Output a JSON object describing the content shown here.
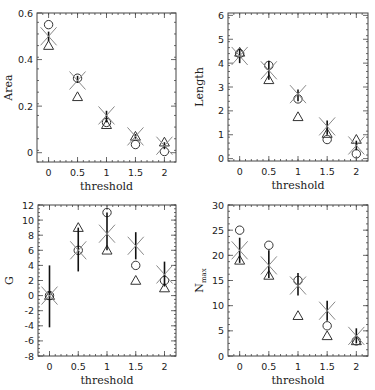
{
  "chart_data": [
    {
      "type": "scatter",
      "panel": "top-left",
      "xlabel": "threshold",
      "ylabel": "Area",
      "x": [
        0,
        0.5,
        1,
        1.5,
        2
      ],
      "xticks": [
        "0",
        "0.5",
        "1",
        "1.5",
        "2"
      ],
      "xlim": [
        -0.2,
        2.2
      ],
      "ylim": [
        -0.04,
        0.6
      ],
      "yticks": [
        0,
        0.2,
        0.4,
        0.6
      ],
      "yticklabels": [
        "0",
        "0.2",
        "0.4",
        "0.6"
      ],
      "series": [
        {
          "name": "circles",
          "marker": "circle",
          "values": [
            0.55,
            0.32,
            0.13,
            0.035,
            0.005
          ]
        },
        {
          "name": "triangles",
          "marker": "triangle",
          "values": [
            0.46,
            0.24,
            0.12,
            0.07,
            0.045
          ]
        },
        {
          "name": "mean",
          "marker": "cross",
          "values": [
            0.5,
            0.31,
            0.16,
            0.07,
            0.03
          ],
          "err_low": [
            0.48,
            0.3,
            0.13,
            0.06,
            0.015
          ],
          "err_high": [
            0.52,
            0.33,
            0.18,
            0.08,
            0.045
          ]
        }
      ]
    },
    {
      "type": "scatter",
      "panel": "top-right",
      "xlabel": "threshold",
      "ylabel": "Length",
      "x": [
        0,
        0.5,
        1,
        1.5,
        2
      ],
      "xticks": [
        "0",
        "0.5",
        "1",
        "1.5",
        "2"
      ],
      "xlim": [
        -0.2,
        2.2
      ],
      "ylim": [
        -0.1,
        6.1
      ],
      "yticks": [
        0,
        1,
        2,
        3,
        4,
        5,
        6
      ],
      "yticklabels": [
        "0",
        "1",
        "2",
        "3",
        "4",
        "5",
        "6"
      ],
      "series": [
        {
          "name": "circles",
          "marker": "circle",
          "values": [
            4.4,
            3.9,
            2.5,
            0.8,
            0.2
          ]
        },
        {
          "name": "triangles",
          "marker": "triangle",
          "values": [
            4.45,
            3.3,
            1.75,
            1.05,
            0.8
          ]
        },
        {
          "name": "mean",
          "marker": "cross",
          "values": [
            4.3,
            3.7,
            2.7,
            1.35,
            0.55
          ],
          "err_low": [
            4.0,
            3.3,
            2.4,
            1.0,
            0.35
          ],
          "err_high": [
            4.6,
            4.1,
            2.9,
            1.6,
            0.75
          ]
        }
      ]
    },
    {
      "type": "scatter",
      "panel": "bottom-left",
      "xlabel": "threshold",
      "ylabel": "G",
      "x": [
        0,
        0.5,
        1,
        1.5,
        2
      ],
      "xticks": [
        "0",
        "0.5",
        "1",
        "1.5",
        "2"
      ],
      "xlim": [
        -0.2,
        2.2
      ],
      "ylim": [
        -8,
        12
      ],
      "yticks": [
        -8,
        -6,
        -4,
        -2,
        0,
        2,
        4,
        6,
        8,
        10,
        12
      ],
      "yticklabels": [
        "-8",
        "-6",
        "-4",
        "-2",
        "0",
        "2",
        "4",
        "6",
        "8",
        "10",
        "12"
      ],
      "series": [
        {
          "name": "circles",
          "marker": "circle",
          "values": [
            0,
            6,
            11,
            4,
            2
          ]
        },
        {
          "name": "triangles",
          "marker": "triangle",
          "values": [
            0,
            9,
            6,
            2,
            1
          ]
        },
        {
          "name": "mean",
          "marker": "cross",
          "values": [
            0,
            6,
            8.2,
            6.6,
            2.8
          ],
          "err_low": [
            -4.2,
            3.2,
            6,
            4.8,
            1.2
          ],
          "err_high": [
            4,
            9,
            11,
            8.4,
            4.5
          ]
        }
      ]
    },
    {
      "type": "scatter",
      "panel": "bottom-right",
      "xlabel": "threshold",
      "ylabel": "N_max",
      "ylabel_main": "N",
      "ylabel_sub": "max",
      "x": [
        0,
        0.5,
        1,
        1.5,
        2
      ],
      "xticks": [
        "0",
        "0.5",
        "1",
        "1.5",
        "2"
      ],
      "xlim": [
        -0.2,
        2.2
      ],
      "ylim": [
        0,
        30
      ],
      "yticks": [
        0,
        5,
        10,
        15,
        20,
        25,
        30
      ],
      "yticklabels": [
        "0",
        "5",
        "10",
        "15",
        "20",
        "25",
        "30"
      ],
      "series": [
        {
          "name": "circles",
          "marker": "circle",
          "values": [
            25,
            22,
            15,
            6,
            3
          ]
        },
        {
          "name": "triangles",
          "marker": "triangle",
          "values": [
            19,
            16,
            8,
            4,
            3
          ]
        },
        {
          "name": "mean",
          "marker": "cross",
          "values": [
            21,
            18,
            14,
            9,
            4
          ],
          "err_low": [
            18.5,
            15.5,
            12,
            7,
            2.5
          ],
          "err_high": [
            23.5,
            21,
            16.5,
            11,
            5.5
          ]
        }
      ]
    }
  ]
}
